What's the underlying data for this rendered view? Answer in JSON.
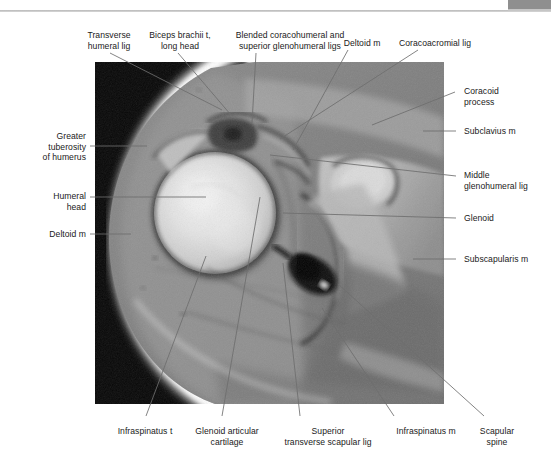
{
  "figure": {
    "type": "axial-mri-shoulder",
    "modality": "MRI",
    "plane": "axial",
    "region": "glenohumeral joint"
  },
  "header": {
    "rule": "horizontal-rule",
    "corner_tab": "page-corner-tab"
  },
  "labels_top": [
    {
      "id": "transverse-humeral-lig",
      "text": "Transverse\nhumeral lig",
      "align": "center",
      "x": 78,
      "y": 30,
      "w": 62
    },
    {
      "id": "biceps-brachii-t",
      "text": "Biceps brachii t,\nlong head",
      "align": "center",
      "x": 145,
      "y": 30,
      "w": 70
    },
    {
      "id": "blended-coracohumeral",
      "text": "Blended coracohumeral and\nsuperior glenohumeral ligs",
      "align": "center",
      "x": 215,
      "y": 30,
      "w": 150
    },
    {
      "id": "deltoid-m-top",
      "text": "Deltoid m",
      "align": "center",
      "x": 337,
      "y": 38,
      "w": 50
    },
    {
      "id": "coracoacromial-lig",
      "text": "Coracoacromial lig",
      "align": "center",
      "x": 390,
      "y": 38,
      "w": 90
    }
  ],
  "labels_right": [
    {
      "id": "coracoid-process",
      "text": "Coracoid\nprocess",
      "x": 464,
      "y": 86
    },
    {
      "id": "subclavius-m",
      "text": "Subclavius m",
      "x": 464,
      "y": 129
    },
    {
      "id": "middle-glenohumeral-lig",
      "text": "Middle\nglenohumeral lig",
      "x": 464,
      "y": 170
    },
    {
      "id": "glenoid",
      "text": "Glenoid",
      "x": 464,
      "y": 214
    },
    {
      "id": "subscapularis-m",
      "text": "Subscapularis m",
      "x": 464,
      "y": 255
    }
  ],
  "labels_left": [
    {
      "id": "greater-tuberosity",
      "text": "Greater\ntuberosity\nof humerus",
      "x": 14,
      "y": 131,
      "w": 72
    },
    {
      "id": "humeral-head",
      "text": "Humeral\nhead",
      "x": 14,
      "y": 191,
      "w": 72
    },
    {
      "id": "deltoid-m-left",
      "text": "Deltoid m",
      "x": 14,
      "y": 229,
      "w": 72
    }
  ],
  "labels_bottom": [
    {
      "id": "infraspinatus-t",
      "text": "Infraspinatus t",
      "x": 106,
      "y": 426,
      "w": 78
    },
    {
      "id": "glenoid-articular-cartilage",
      "text": "Glenoid articular\ncartilage",
      "x": 186,
      "y": 426,
      "w": 82
    },
    {
      "id": "superior-transverse-scapular-lig",
      "text": "Superior\ntransverse scapular lig",
      "x": 274,
      "y": 426,
      "w": 108
    },
    {
      "id": "infraspinatus-m",
      "text": "Infraspinatus m",
      "x": 386,
      "y": 426,
      "w": 80
    },
    {
      "id": "scapular-spine",
      "text": "Scapular\nspine",
      "x": 468,
      "y": 426,
      "w": 58
    }
  ],
  "leaders": [
    {
      "id": "leader-transverse-humeral-lig",
      "points": "110,53 222,110"
    },
    {
      "id": "leader-biceps-brachii-t",
      "points": "178,53 231,115"
    },
    {
      "id": "leader-blended-coracohumeral",
      "points": "256,53 252,123"
    },
    {
      "id": "leader-deltoid-m-top",
      "points": "348,50 293,150"
    },
    {
      "id": "leader-coracoacromial-lig",
      "points": "418,50 280,139"
    },
    {
      "id": "leader-coracoid-process",
      "points": "455,92 372,125"
    },
    {
      "id": "leader-subclavius-m",
      "points": "456,131 423,131"
    },
    {
      "id": "leader-middle-glenohumeral-lig",
      "points": "456,176 270,155"
    },
    {
      "id": "leader-glenoid",
      "points": "456,218 283,213"
    },
    {
      "id": "leader-subscapularis-m",
      "points": "456,259 413,259"
    },
    {
      "id": "leader-greater-tuberosity",
      "points": "90,146 147,146"
    },
    {
      "id": "leader-humeral-head",
      "points": "90,197 206,197"
    },
    {
      "id": "leader-deltoid-m-left",
      "points": "90,234 131,234"
    },
    {
      "id": "leader-infraspinatus-t",
      "points": "146,416 206,256"
    },
    {
      "id": "leader-glenoid-articular",
      "points": "222,416 260,197"
    },
    {
      "id": "leader-superior-transverse",
      "points": "300,416 283,263"
    },
    {
      "id": "leader-infraspinatus-m",
      "points": "394,416 322,308"
    },
    {
      "id": "leader-scapular-spine",
      "points": "484,416 338,284"
    }
  ],
  "colors": {
    "leader": "#6e6e6e",
    "text": "#1a1a1a",
    "rule": "#b9b9b9",
    "tab": "#8f8f8f",
    "plate_background": "#000000"
  }
}
